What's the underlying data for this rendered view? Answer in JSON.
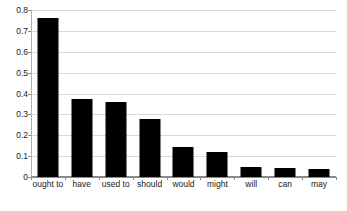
{
  "chart_data": {
    "type": "bar",
    "title": "",
    "xlabel": "",
    "ylabel": "",
    "categories": [
      "ought to",
      "have",
      "used to",
      "should",
      "would",
      "might",
      "will",
      "can",
      "may"
    ],
    "values": [
      0.76,
      0.375,
      0.36,
      0.28,
      0.145,
      0.12,
      0.05,
      0.045,
      0.04
    ],
    "ylim": [
      0,
      0.8
    ],
    "yticks": [
      "0",
      "0.1",
      "0.2",
      "0.3",
      "0.4",
      "0.5",
      "0.6",
      "0.7",
      "0.8"
    ],
    "ytick_values": [
      0,
      0.1,
      0.2,
      0.3,
      0.4,
      0.5,
      0.6,
      0.7,
      0.8
    ],
    "grid": true,
    "legend": null,
    "bar_color": "#000000",
    "grid_color": "#d9d9d9",
    "axis_color": "#8a8a8a",
    "background": "#ffffff"
  }
}
